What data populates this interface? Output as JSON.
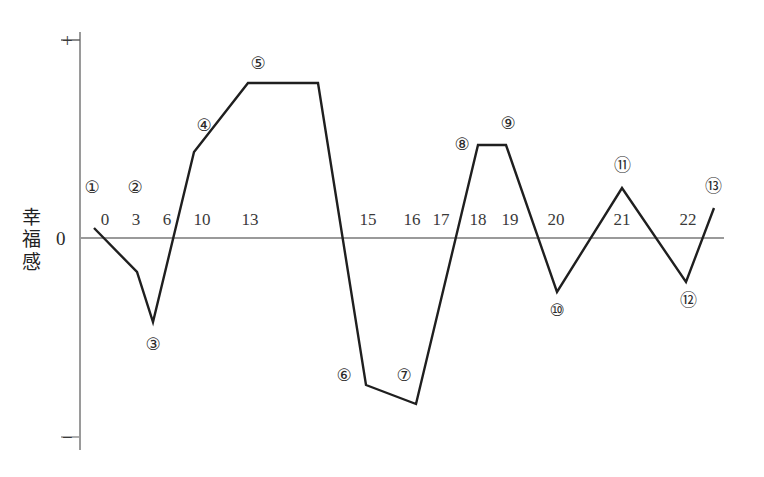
{
  "chart_data": {
    "type": "line",
    "title": "",
    "xlabel": "",
    "ylabel": "幸福感",
    "ylim": [
      -1,
      1
    ],
    "grid": false,
    "legend": null,
    "axis_markers": {
      "positive": "+",
      "negative": "−",
      "zero": "0"
    },
    "x_tick_labels": [
      "0",
      "3",
      "6",
      "10",
      "13",
      "15",
      "16",
      "17",
      "18",
      "19",
      "20",
      "21",
      "22"
    ],
    "x_tick_positions_px": [
      105,
      136,
      167,
      202,
      250,
      368,
      412,
      441,
      478,
      510,
      556,
      622,
      688
    ],
    "point_labels": [
      "①",
      "②",
      "③",
      "④",
      "⑤",
      "⑥",
      "⑦",
      "⑧",
      "⑨",
      "⑩",
      "⑪",
      "⑫",
      "⑬"
    ],
    "point_label_positions_px": [
      {
        "label": "①",
        "x": 92,
        "y": 187
      },
      {
        "label": "②",
        "x": 135,
        "y": 187
      },
      {
        "label": "③",
        "x": 153,
        "y": 344
      },
      {
        "label": "④",
        "x": 204,
        "y": 125
      },
      {
        "label": "⑤",
        "x": 258,
        "y": 63
      },
      {
        "label": "⑥",
        "x": 344,
        "y": 375
      },
      {
        "label": "⑦",
        "x": 404,
        "y": 375
      },
      {
        "label": "⑧",
        "x": 462,
        "y": 144
      },
      {
        "label": "⑨",
        "x": 508,
        "y": 123
      },
      {
        "label": "⑩",
        "x": 557,
        "y": 310
      },
      {
        "label": "⑪",
        "x": 622,
        "y": 165
      },
      {
        "label": "⑫",
        "x": 688,
        "y": 300
      },
      {
        "label": "⑬",
        "x": 713,
        "y": 186
      }
    ],
    "series": [
      {
        "name": "幸福感",
        "points_px": [
          {
            "x": 94,
            "y": 228
          },
          {
            "x": 137,
            "y": 272
          },
          {
            "x": 153,
            "y": 322
          },
          {
            "x": 194,
            "y": 152
          },
          {
            "x": 248,
            "y": 83
          },
          {
            "x": 318,
            "y": 83
          },
          {
            "x": 366,
            "y": 385
          },
          {
            "x": 416,
            "y": 404
          },
          {
            "x": 478,
            "y": 145
          },
          {
            "x": 506,
            "y": 145
          },
          {
            "x": 557,
            "y": 292
          },
          {
            "x": 622,
            "y": 188
          },
          {
            "x": 686,
            "y": 282
          },
          {
            "x": 714,
            "y": 208
          }
        ],
        "values_relative": [
          0.05,
          -0.21,
          -0.41,
          0.41,
          0.74,
          0.74,
          -0.71,
          -0.8,
          0.44,
          0.44,
          -0.26,
          0.24,
          -0.21,
          0.14
        ]
      }
    ],
    "axes_px": {
      "y_axis_x": 80,
      "y_axis_top": 32,
      "y_axis_bottom": 450,
      "zero_line_y": 238,
      "zero_line_x_start": 80,
      "zero_line_x_end": 724
    },
    "colors": {
      "line": "#1f1f1f",
      "axis": "#9a9a9a",
      "zero_line": "#9a9a9a",
      "text": "#2b2b2b",
      "background": "#ffffff"
    }
  }
}
